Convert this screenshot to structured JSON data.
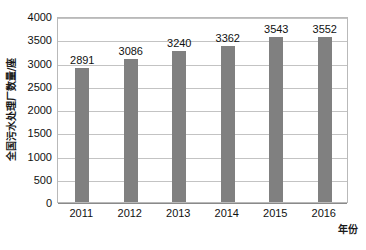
{
  "chart_data": {
    "type": "bar",
    "title": "",
    "subtitle": "",
    "categories": [
      "2011",
      "2012",
      "2013",
      "2014",
      "2015",
      "2016"
    ],
    "values": [
      2891,
      3086,
      3240,
      3362,
      3543,
      3552
    ],
    "data_labels": [
      "2891",
      "3086",
      "3240",
      "3362",
      "3543",
      "3552"
    ],
    "xlabel": "年份",
    "ylabel": "全国污水处理厂数量/座",
    "ylim": [
      0,
      4000
    ],
    "y_tick_step": 500,
    "y_tick_labels": [
      "4000",
      "3500",
      "3000",
      "2500",
      "2000",
      "1500",
      "1000",
      "500",
      "0"
    ],
    "y_tick_values": [
      4000,
      3500,
      3000,
      2500,
      2000,
      1500,
      1000,
      500,
      0
    ],
    "grid": true,
    "grid_axis": "y",
    "legend": false,
    "legend_position": "none",
    "bar_color": "#808080",
    "gridline_color": "#c3c3c3",
    "plot_border_color": "#b9b9b9",
    "background_color": "#ffffff",
    "text_color": "#111111",
    "series": [
      {
        "name": "全国污水处理厂数量",
        "values": [
          2891,
          3086,
          3240,
          3362,
          3543,
          3552
        ]
      }
    ]
  }
}
